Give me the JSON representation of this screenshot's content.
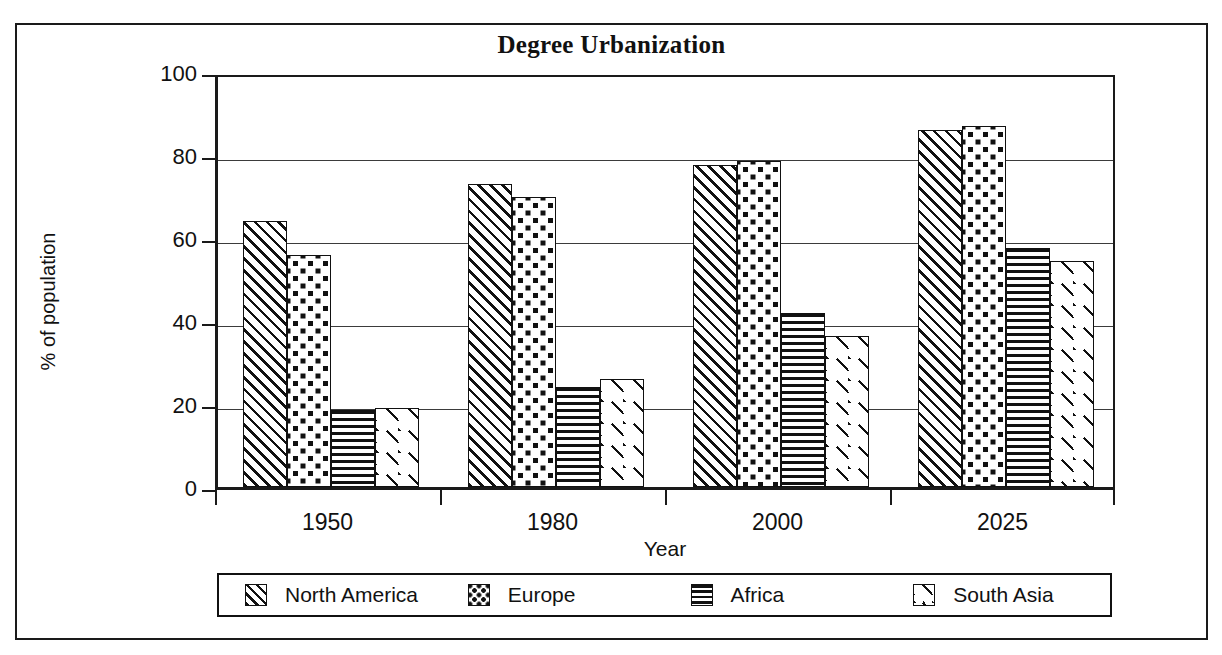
{
  "chart_data": {
    "type": "bar",
    "title": "Degree Urbanization",
    "xlabel": "Year",
    "ylabel": "% of population",
    "categories": [
      "1950",
      "1980",
      "2000",
      "2025"
    ],
    "series": [
      {
        "name": "North America",
        "pattern": "diagonal-hatch",
        "values": [
          64,
          73,
          77.5,
          86
        ]
      },
      {
        "name": "Europe",
        "pattern": "checkered-dots",
        "values": [
          56,
          70,
          78.5,
          87
        ]
      },
      {
        "name": "Africa",
        "pattern": "horizontal-lines",
        "values": [
          18.5,
          24,
          42,
          57.5
        ]
      },
      {
        "name": "South Asia",
        "pattern": "sparse-dashes",
        "values": [
          19,
          26,
          36.5,
          54.5
        ]
      }
    ],
    "ylim": [
      0,
      100
    ],
    "yticks": [
      0,
      20,
      40,
      60,
      80,
      100
    ],
    "ytick_labels": [
      "0",
      "20",
      "40",
      "60",
      "80",
      "100"
    ],
    "grid": true,
    "legend_position": "bottom",
    "colors": {
      "ink": "#111111",
      "background": "#ffffff",
      "gridline": "#3b3b3b",
      "frame": "#1a1a1a"
    }
  }
}
